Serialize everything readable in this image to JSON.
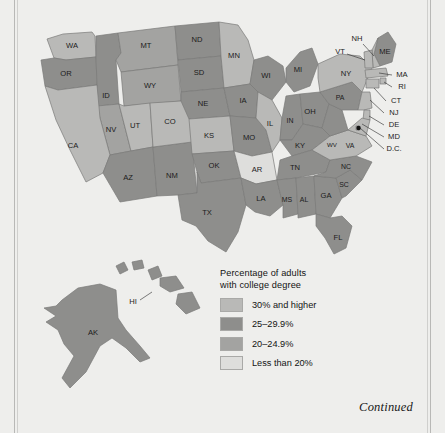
{
  "figure": {
    "continued_label": "Continued"
  },
  "legend": {
    "title_line1": "Percentage of adults",
    "title_line2": "with college degree",
    "entries": [
      {
        "label": "30% and higher",
        "color": "#b9b9b7",
        "class_key": "c30plus"
      },
      {
        "label": "25–29.9%",
        "color": "#8e8e8c",
        "class_key": "c25"
      },
      {
        "label": "20–24.9%",
        "color": "#a3a3a1",
        "class_key": "c20"
      },
      {
        "label": "Less than 20%",
        "color": "#dededc",
        "class_key": "clow"
      }
    ]
  },
  "chart_data": {
    "type": "map",
    "title": "Percentage of adults with college degree",
    "map_kind": "choropleth",
    "region": "United States",
    "legend_position": "center-bottom",
    "categories": [
      "30% and higher",
      "25-29.9%",
      "20-24.9%",
      "Less than 20%"
    ],
    "category_colors": [
      "#b9b9b7",
      "#8e8e8c",
      "#a3a3a1",
      "#dededc"
    ],
    "insets": [
      "AK",
      "HI"
    ],
    "states": [
      {
        "code": "WA",
        "category": "30% and higher"
      },
      {
        "code": "OR",
        "category": "25-29.9%"
      },
      {
        "code": "ID",
        "category": "25-29.9%"
      },
      {
        "code": "MT",
        "category": "20-24.9%"
      },
      {
        "code": "WY",
        "category": "20-24.9%"
      },
      {
        "code": "NV",
        "category": "20-24.9%"
      },
      {
        "code": "CA",
        "category": "30% and higher"
      },
      {
        "code": "UT",
        "category": "30% and higher"
      },
      {
        "code": "AZ",
        "category": "25-29.9%"
      },
      {
        "code": "NM",
        "category": "25-29.9%"
      },
      {
        "code": "CO",
        "category": "30% and higher"
      },
      {
        "code": "ND",
        "category": "25-29.9%"
      },
      {
        "code": "SD",
        "category": "25-29.9%"
      },
      {
        "code": "NE",
        "category": "25-29.9%"
      },
      {
        "code": "KS",
        "category": "30% and higher"
      },
      {
        "code": "OK",
        "category": "25-29.9%"
      },
      {
        "code": "TX",
        "category": "25-29.9%"
      },
      {
        "code": "MN",
        "category": "30% and higher"
      },
      {
        "code": "IA",
        "category": "25-29.9%"
      },
      {
        "code": "MO",
        "category": "25-29.9%"
      },
      {
        "code": "AR",
        "category": "Less than 20%"
      },
      {
        "code": "LA",
        "category": "25-29.9%"
      },
      {
        "code": "WI",
        "category": "25-29.9%"
      },
      {
        "code": "IL",
        "category": "30% and higher"
      },
      {
        "code": "MI",
        "category": "25-29.9%"
      },
      {
        "code": "IN",
        "category": "25-29.9%"
      },
      {
        "code": "OH",
        "category": "25-29.9%"
      },
      {
        "code": "KY",
        "category": "25-29.9%"
      },
      {
        "code": "TN",
        "category": "25-29.9%"
      },
      {
        "code": "MS",
        "category": "25-29.9%"
      },
      {
        "code": "AL",
        "category": "25-29.9%"
      },
      {
        "code": "GA",
        "category": "25-29.9%"
      },
      {
        "code": "FL",
        "category": "25-29.9%"
      },
      {
        "code": "SC",
        "category": "25-29.9%"
      },
      {
        "code": "NC",
        "category": "25-29.9%"
      },
      {
        "code": "VA",
        "category": "30% and higher"
      },
      {
        "code": "WV",
        "category": "25-29.9%"
      },
      {
        "code": "PA",
        "category": "25-29.9%"
      },
      {
        "code": "NY",
        "category": "30% and higher"
      },
      {
        "code": "ME",
        "category": "25-29.9%"
      },
      {
        "code": "NH",
        "category": "30% and higher"
      },
      {
        "code": "VT",
        "category": "30% and higher"
      },
      {
        "code": "MA",
        "category": "30% and higher"
      },
      {
        "code": "RI",
        "category": "30% and higher"
      },
      {
        "code": "CT",
        "category": "30% and higher"
      },
      {
        "code": "NJ",
        "category": "30% and higher"
      },
      {
        "code": "DE",
        "category": "30% and higher"
      },
      {
        "code": "MD",
        "category": "30% and higher"
      },
      {
        "code": "D.C.",
        "category": "30% and higher"
      },
      {
        "code": "AK",
        "category": "25-29.9%"
      },
      {
        "code": "HI",
        "category": "25-29.9%"
      }
    ]
  },
  "map_labels": {
    "WA": "WA",
    "OR": "OR",
    "ID": "ID",
    "MT": "MT",
    "WY": "WY",
    "NV": "NV",
    "CA": "CA",
    "UT": "UT",
    "AZ": "AZ",
    "NM": "NM",
    "CO": "CO",
    "ND": "ND",
    "SD": "SD",
    "NE": "NE",
    "KS": "KS",
    "OK": "OK",
    "TX": "TX",
    "MN": "MN",
    "IA": "IA",
    "MO": "MO",
    "AR": "AR",
    "LA": "LA",
    "WI": "WI",
    "IL": "IL",
    "MI": "MI",
    "IN": "IN",
    "OH": "OH",
    "KY": "KY",
    "TN": "TN",
    "MS": "MS",
    "AL": "AL",
    "GA": "GA",
    "FL": "FL",
    "SC": "SC",
    "NC": "NC",
    "VA": "VA",
    "WV": "WV",
    "PA": "PA",
    "NY": "NY",
    "ME": "ME",
    "NH": "NH",
    "VT": "VT",
    "MA": "MA",
    "RI": "RI",
    "CT": "CT",
    "NJ": "NJ",
    "DE": "DE",
    "MD": "MD",
    "DC": "D.C.",
    "AK": "AK",
    "HI": "HI"
  }
}
